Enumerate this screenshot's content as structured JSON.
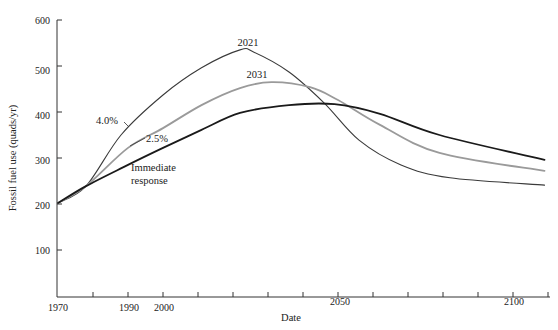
{
  "chart_data": {
    "type": "line",
    "title": "",
    "xlabel": "Date",
    "ylabel": "Fossil fuel use (quads/yr)",
    "xlim": [
      1970,
      2110
    ],
    "ylim": [
      0,
      600
    ],
    "grid": false,
    "legend": "none (inline curve annotations)",
    "y_ticks": [
      100,
      200,
      300,
      400,
      500,
      600
    ],
    "x_ticks": [
      1970,
      1980,
      1990,
      2000,
      2010,
      2020,
      2030,
      2040,
      2050,
      2060,
      2070,
      2080,
      2090,
      2100,
      2110
    ],
    "x_tick_labels": [
      "1970",
      "1990",
      "2000",
      "2050",
      "2100"
    ],
    "series": [
      {
        "name": "2021 (4.0% growth)",
        "peak_label": "2021",
        "growth_label": "4.0%",
        "color": "#3a3a3a",
        "width": 1.1,
        "x": [
          1970,
          1978,
          1988,
          2000,
          2011,
          2022,
          2026,
          2036,
          2046,
          2056,
          2068,
          2082,
          2109
        ],
        "y": [
          202,
          239,
          350,
          437,
          496,
          535,
          530,
          487,
          420,
          339,
          285,
          257,
          241
        ]
      },
      {
        "name": "2031 (2.5% growth)",
        "peak_label": "2031",
        "growth_label": "2.5%",
        "color": "#9a9a9a",
        "width": 1.8,
        "x": [
          1970,
          1978,
          1990,
          2000,
          2011,
          2022,
          2031,
          2042,
          2050,
          2062,
          2079,
          2109
        ],
        "y": [
          202,
          239,
          322,
          365,
          415,
          452,
          465,
          454,
          426,
          372,
          311,
          272
        ]
      },
      {
        "name": "Immediate response",
        "peak_label": "",
        "growth_label": "Immediate response",
        "color": "#1a1a1a",
        "width": 1.8,
        "x": [
          1970,
          1978,
          1990,
          2000,
          2011,
          2022,
          2036,
          2049,
          2062,
          2079,
          2109
        ],
        "y": [
          202,
          239,
          285,
          322,
          361,
          398,
          415,
          417,
          396,
          350,
          296
        ]
      }
    ],
    "annotations": [
      {
        "text": "2021",
        "x": 2022,
        "y": 560
      },
      {
        "text": "2031",
        "x": 2030,
        "y": 487
      },
      {
        "text": "4.0%",
        "x": 1981,
        "y": 398
      },
      {
        "text": "2.5%",
        "x": 1994,
        "y": 330
      },
      {
        "text": "Immediate",
        "x": 1990,
        "y": 273
      },
      {
        "text": "response",
        "x": 1990,
        "y": 245
      }
    ]
  },
  "labels": {
    "y_axis": "Fossil fuel use (quads/yr)",
    "x_axis": "Date",
    "y_tick_600": "600",
    "y_tick_500": "500",
    "y_tick_400": "400",
    "y_tick_300": "300",
    "y_tick_200": "200",
    "y_tick_100": "100",
    "x_tick_1970": "1970",
    "x_tick_1990": "1990",
    "x_tick_2000": "2000",
    "x_tick_2050": "2050",
    "x_tick_2100": "2100",
    "peak_2021": "2021",
    "peak_2031": "2031",
    "growth_40": "4.0%",
    "growth_25": "2.5%",
    "immediate_line1": "Immediate",
    "immediate_line2": "response"
  }
}
